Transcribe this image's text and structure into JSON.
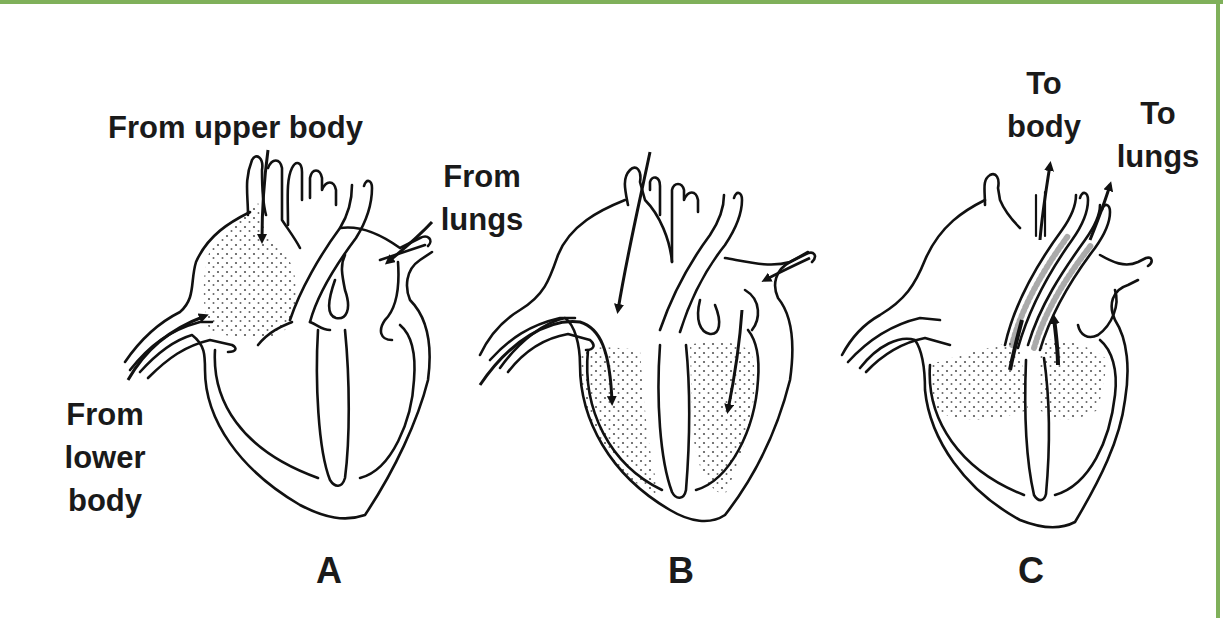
{
  "figure": {
    "border_color": "#7fb05a",
    "panels": [
      {
        "id": "A",
        "letter": "A",
        "labels": {
          "upper": "From upper body",
          "lungs_line1": "From",
          "lungs_line2": "lungs",
          "lower_line1": "From",
          "lower_line2": "lower",
          "lower_line3": "body"
        },
        "shaded_region": "right atrium"
      },
      {
        "id": "B",
        "letter": "B",
        "labels": {},
        "shaded_region": "both ventricles"
      },
      {
        "id": "C",
        "letter": "C",
        "labels": {
          "body_line1": "To",
          "body_line2": "body",
          "lungs_line1": "To",
          "lungs_line2": "lungs"
        },
        "shaded_region": "ventricles and great arteries"
      }
    ]
  }
}
